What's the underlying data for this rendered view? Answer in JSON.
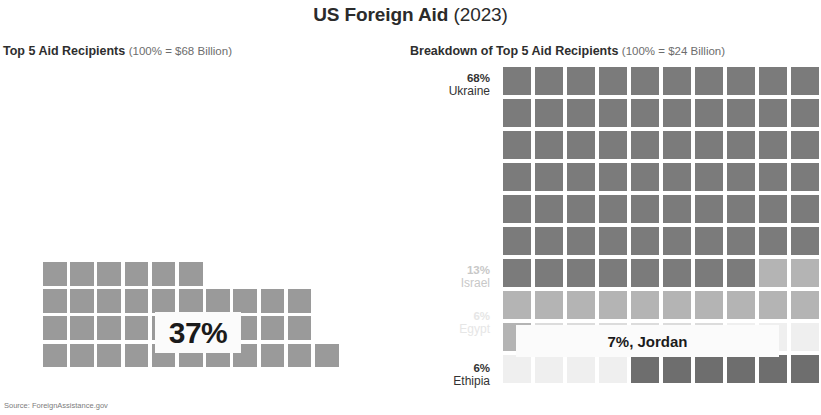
{
  "header": {
    "title_main": "US Foreign Aid",
    "title_year": "(2023)"
  },
  "left_panel": {
    "subtitle_main": "Top 5 Aid Recipients",
    "subtitle_note": "(100% = $68 Billion)",
    "callout_label": "37%"
  },
  "right_panel": {
    "subtitle_main": "Breakdown of Top 5 Aid Recipients",
    "subtitle_note": "(100% = $24 Billion)",
    "callout_label": "7%, Jordan",
    "row_labels": [
      {
        "pct": "68%",
        "name": "Ukraine"
      },
      {
        "pct": "13%",
        "name": "Israel"
      },
      {
        "pct": "6%",
        "name": "Egypt"
      },
      {
        "pct": "6%",
        "name": "Ethipia"
      }
    ]
  },
  "footer": {
    "source": "Source: ForeignAssistance.gov"
  },
  "colors": {
    "cell_left": "#9a9a9a",
    "ukraine": "#7b7b7b",
    "israel": "#b4b4b4",
    "egypt": "#dcdcdc",
    "jordan": "#efefef",
    "ethiopia": "#6e6e6e",
    "background": "#ffffff",
    "title_text": "#2b2b2b",
    "label_strong": "#333333",
    "label_faded_1": "#c8c8c8",
    "label_faded_2": "#e4e4e4"
  },
  "chart_data": {
    "type": "table",
    "charts": [
      {
        "type": "waffle",
        "title": "Top 5 Aid Recipients",
        "total_label": "100% = $68 Billion",
        "value_pct": 37,
        "value_label": "37%",
        "unit_per_cell_pct": 1,
        "grid_cols": 10,
        "grid_rows": 4,
        "filled_cells": 37,
        "row_counts": [
          6,
          10,
          10,
          11
        ],
        "cell_color": "#9a9a9a"
      },
      {
        "type": "waffle",
        "title": "Breakdown of Top 5 Aid Recipients",
        "total_label": "100% = $24 Billion",
        "grid_cols": 10,
        "grid_rows": 10,
        "total_cells": 100,
        "categories": [
          "Ukraine",
          "Israel",
          "Egypt",
          "Jordan",
          "Ethipia"
        ],
        "values": [
          68,
          13,
          6,
          7,
          6
        ],
        "colors": [
          "#7b7b7b",
          "#b4b4b4",
          "#dcdcdc",
          "#efefef",
          "#6e6e6e"
        ],
        "labels_shown": [
          "68% Ukraine",
          "13% Israel",
          "6% Egypt",
          "7%, Jordan",
          "6% Ethipia"
        ],
        "fill_order": [
          "Ukraine",
          "Israel",
          "Egypt",
          "Jordan",
          "Ethipia"
        ]
      }
    ],
    "source": "Source: ForeignAssistance.gov"
  }
}
